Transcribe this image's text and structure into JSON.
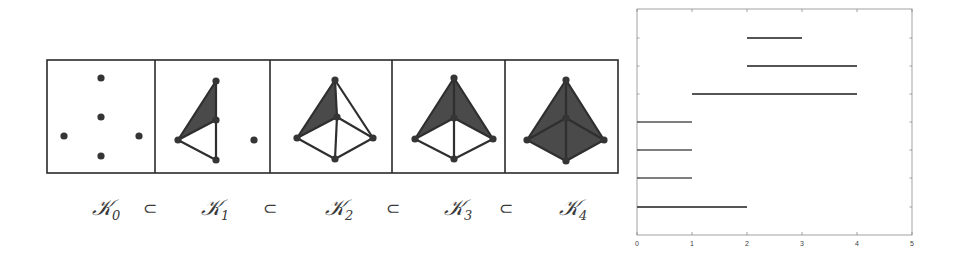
{
  "filtration": {
    "frame": {
      "x": 47,
      "y": 60,
      "width": 571,
      "height": 113,
      "dividers": [
        155,
        270,
        392,
        505
      ]
    },
    "colors": {
      "stroke": "#2f2f2f",
      "fill": "#4a4a4a",
      "vertex": "#353535"
    },
    "panels": [
      {
        "id": "K0",
        "label": "K",
        "subscript": "0",
        "label_x": 92,
        "vertices": {
          "top": [
            101,
            78
          ],
          "mid": [
            101,
            117
          ],
          "left": [
            64,
            136
          ],
          "right": [
            139,
            136
          ],
          "bottom": [
            101,
            156
          ]
        },
        "edges": [],
        "triangles": []
      },
      {
        "id": "K1",
        "label": "K",
        "subscript": "1",
        "label_x": 201,
        "vertices": {
          "top": [
            216,
            81
          ],
          "mid": [
            216,
            120
          ],
          "left": [
            178,
            140
          ],
          "bottom": [
            216,
            160
          ],
          "free": [
            254,
            140
          ]
        },
        "edges": [
          [
            "top",
            "mid"
          ],
          [
            "top",
            "left"
          ],
          [
            "mid",
            "left"
          ],
          [
            "mid",
            "bottom"
          ],
          [
            "left",
            "bottom"
          ]
        ],
        "triangles": [
          [
            "top",
            "mid",
            "left"
          ]
        ]
      },
      {
        "id": "K2",
        "label": "K",
        "subscript": "2",
        "label_x": 325,
        "vertices": {
          "top": [
            335,
            80
          ],
          "mid": [
            337,
            117
          ],
          "left": [
            297,
            138
          ],
          "right": [
            373,
            138
          ],
          "bottom": [
            335,
            159
          ]
        },
        "edges": [
          [
            "top",
            "mid"
          ],
          [
            "top",
            "left"
          ],
          [
            "top",
            "right"
          ],
          [
            "mid",
            "left"
          ],
          [
            "mid",
            "right"
          ],
          [
            "mid",
            "bottom"
          ],
          [
            "left",
            "bottom"
          ],
          [
            "right",
            "bottom"
          ]
        ],
        "triangles": [
          [
            "top",
            "mid",
            "left"
          ]
        ]
      },
      {
        "id": "K3",
        "label": "K",
        "subscript": "3",
        "label_x": 444,
        "vertices": {
          "top": [
            454,
            78
          ],
          "mid": [
            454,
            118
          ],
          "left": [
            415,
            139
          ],
          "right": [
            493,
            139
          ],
          "bottom": [
            454,
            159
          ]
        },
        "edges": [
          [
            "top",
            "mid"
          ],
          [
            "top",
            "left"
          ],
          [
            "top",
            "right"
          ],
          [
            "mid",
            "left"
          ],
          [
            "mid",
            "right"
          ],
          [
            "mid",
            "bottom"
          ],
          [
            "left",
            "bottom"
          ],
          [
            "right",
            "bottom"
          ]
        ],
        "triangles": [
          [
            "top",
            "mid",
            "left"
          ],
          [
            "top",
            "mid",
            "right"
          ]
        ]
      },
      {
        "id": "K4",
        "label": "K",
        "subscript": "4",
        "label_x": 559,
        "vertices": {
          "top": [
            566,
            80
          ],
          "mid": [
            566,
            118
          ],
          "left": [
            527,
            140
          ],
          "right": [
            604,
            140
          ],
          "bottom": [
            566,
            161
          ]
        },
        "edges": [
          [
            "top",
            "mid"
          ],
          [
            "top",
            "left"
          ],
          [
            "top",
            "right"
          ],
          [
            "mid",
            "left"
          ],
          [
            "mid",
            "right"
          ],
          [
            "mid",
            "bottom"
          ],
          [
            "left",
            "bottom"
          ],
          [
            "right",
            "bottom"
          ]
        ],
        "triangles": [
          [
            "top",
            "mid",
            "left"
          ],
          [
            "top",
            "mid",
            "right"
          ],
          [
            "left",
            "mid",
            "bottom"
          ],
          [
            "right",
            "mid",
            "bottom"
          ]
        ]
      }
    ],
    "subset_symbol": "⊂",
    "subset_positions": [
      150,
      270,
      393,
      506
    ],
    "label_baseline": 215
  },
  "chart_data": {
    "type": "barcode",
    "title": "",
    "xlabel": "",
    "ylabel": "",
    "xlim": [
      0,
      5
    ],
    "xticks": [
      0,
      1,
      2,
      3,
      4,
      5
    ],
    "grid": false,
    "frame": {
      "left": 637,
      "top": 9,
      "right": 912,
      "bottom": 235
    },
    "color": "#555555",
    "bars": [
      {
        "start": 2,
        "end": 3,
        "y": 38
      },
      {
        "start": 2,
        "end": 4,
        "y": 66
      },
      {
        "start": 1,
        "end": 4,
        "y": 94
      },
      {
        "start": 0,
        "end": 1,
        "y": 122
      },
      {
        "start": 0,
        "end": 1,
        "y": 150
      },
      {
        "start": 0,
        "end": 1,
        "y": 178
      },
      {
        "start": 0,
        "end": 2,
        "y": 207
      }
    ],
    "yticks_px": [
      38,
      66,
      94,
      122,
      150,
      178,
      207
    ]
  }
}
